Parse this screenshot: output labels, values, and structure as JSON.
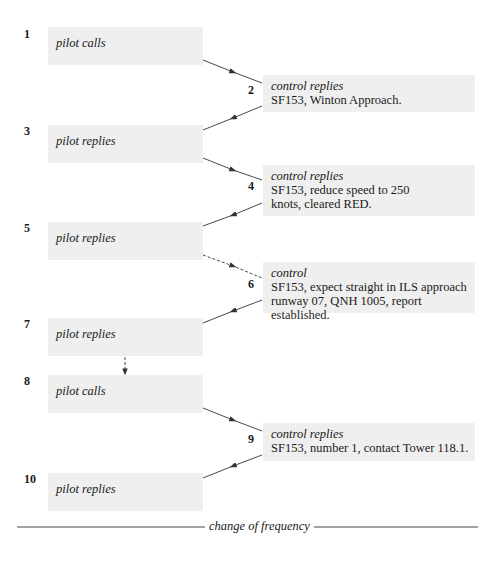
{
  "diagram": {
    "steps": [
      {
        "num": "1",
        "speaker": "pilot",
        "role": "pilot calls",
        "message": ""
      },
      {
        "num": "2",
        "speaker": "control",
        "role": "control replies",
        "message": "SF153, Winton Approach."
      },
      {
        "num": "3",
        "speaker": "pilot",
        "role": "pilot replies",
        "message": ""
      },
      {
        "num": "4",
        "speaker": "control",
        "role": "control replies",
        "message": "SF153, reduce speed to 250 knots, cleared RED."
      },
      {
        "num": "5",
        "speaker": "pilot",
        "role": "pilot replies",
        "message": ""
      },
      {
        "num": "6",
        "speaker": "control",
        "role": "control",
        "message": "SF153, expect straight in ILS approach runway 07, QNH 1005, report established."
      },
      {
        "num": "7",
        "speaker": "pilot",
        "role": "pilot replies",
        "message": ""
      },
      {
        "num": "8",
        "speaker": "pilot",
        "role": "pilot calls",
        "message": ""
      },
      {
        "num": "9",
        "speaker": "control",
        "role": "control replies",
        "message": "SF153, number 1, contact Tower 118.1."
      },
      {
        "num": "10",
        "speaker": "pilot",
        "role": "pilot replies",
        "message": ""
      }
    ],
    "footer": "change of frequency",
    "colors": {
      "box_fill": "#efefef",
      "line": "#333333"
    }
  }
}
